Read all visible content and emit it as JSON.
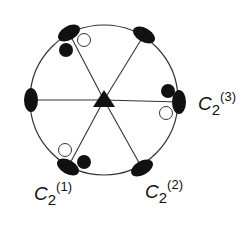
{
  "diagram": {
    "title": "",
    "type": "symmetry-projection",
    "center_symbol": "filled-triangle",
    "circle": {
      "cx": 104,
      "cy": 100,
      "rx": 74,
      "ry": 75
    },
    "stroke_color": "#333333",
    "fill_color": "#111111",
    "axis_ends": [
      {
        "x": 31,
        "y": 100,
        "angle": 90
      },
      {
        "x": 179,
        "y": 102,
        "angle": 90
      },
      {
        "x": 69,
        "y": 33,
        "angle": -30
      },
      {
        "x": 144,
        "y": 35,
        "angle": 30
      },
      {
        "x": 68,
        "y": 167,
        "angle": 30
      },
      {
        "x": 142,
        "y": 168,
        "angle": -30
      }
    ],
    "filled_dots": [
      {
        "x": 66,
        "y": 50
      },
      {
        "x": 168,
        "y": 91
      },
      {
        "x": 84,
        "y": 162
      }
    ],
    "open_dots": [
      {
        "x": 84,
        "y": 40
      },
      {
        "x": 166,
        "y": 113
      },
      {
        "x": 65,
        "y": 150
      }
    ],
    "labels": [
      {
        "base": "C",
        "sub": "2",
        "sup": "(1)",
        "x": 34,
        "y": 180
      },
      {
        "base": "C",
        "sub": "2",
        "sup": "(2)",
        "x": 145,
        "y": 178
      },
      {
        "base": "C",
        "sub": "2",
        "sup": "(3)",
        "x": 198,
        "y": 90
      }
    ]
  }
}
